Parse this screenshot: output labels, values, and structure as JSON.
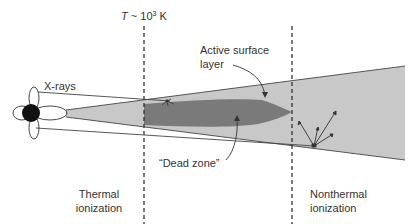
{
  "diagram": {
    "temperature_label": {
      "symbol": "T",
      "approx": " ~ 10",
      "exponent": "3",
      "unit": " K"
    },
    "labels": {
      "xrays": "X-rays",
      "active_surface_line1": "Active surface",
      "active_surface_line2": "layer",
      "dead_zone": "“Dead zone”",
      "thermal_line1": "Thermal",
      "thermal_line2": "ionization",
      "nonthermal_line1": "Nonthermal",
      "nonthermal_line2": "ionization"
    },
    "colors": {
      "disk_fill": "#c8c8c8",
      "dead_zone_fill": "#7a7a7a",
      "star_fill": "#111111",
      "line": "#444444",
      "text": "#333333"
    }
  }
}
